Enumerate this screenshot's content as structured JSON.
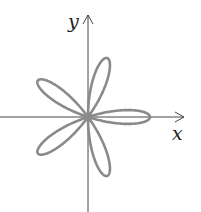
{
  "diagram": {
    "type": "polar-rose",
    "equation_shape": "r = cos(5θ)",
    "petals": 5,
    "petal_angles_deg": [
      0,
      72,
      144,
      216,
      288
    ],
    "axes": {
      "x_label": "x",
      "y_label": "y"
    },
    "colors": {
      "curve": "#8a8a8a",
      "axis": "#444444",
      "background": "#ffffff"
    }
  }
}
